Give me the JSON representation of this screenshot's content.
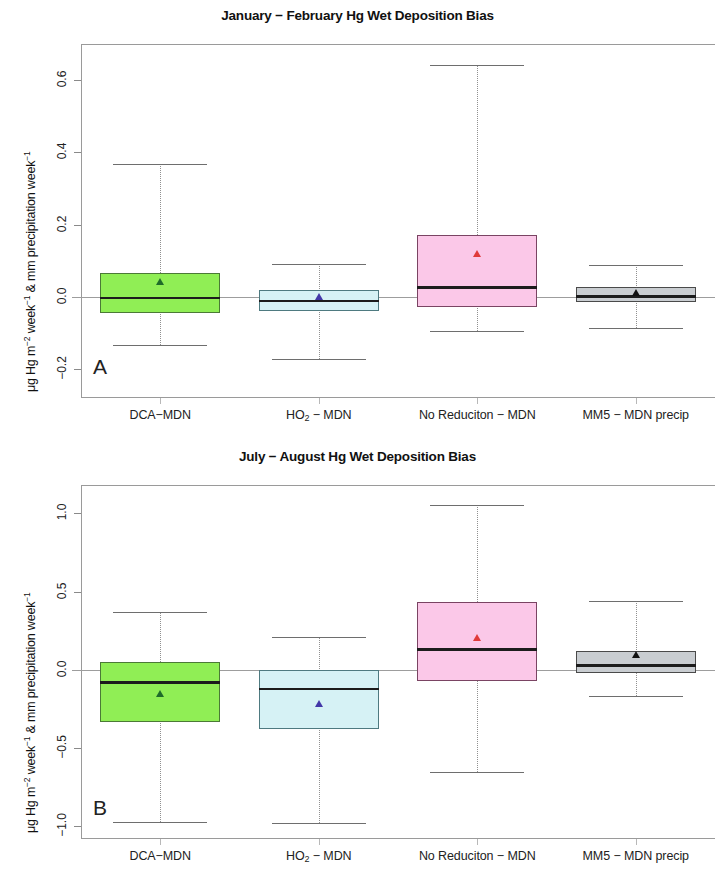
{
  "figure": {
    "y_axis_title_prefix": "μg Hg m",
    "y_axis_title_sup1": "−2",
    "y_axis_title_mid": " week",
    "y_axis_title_sup2": "−1",
    "y_axis_title_tail": " & mm precipitation week",
    "y_axis_title_sup3": "−1"
  },
  "chart_data": [
    {
      "type": "box",
      "panel_letter": "A",
      "title": "January − February Hg Wet Deposition Bias",
      "xlabel": "",
      "ylabel": "μg Hg m−2 week−1 & mm precipitation week−1",
      "ylim": [
        -0.28,
        0.7
      ],
      "yticks": [
        -0.2,
        0.0,
        0.2,
        0.4,
        0.6
      ],
      "ytick_labels": [
        "−0.2",
        "0.0",
        "0.2",
        "0.4",
        "0.6"
      ],
      "grid": false,
      "zero_line": 0.0,
      "categories": [
        "DCA−MDN",
        "HO2 − MDN",
        "No Reduciton − MDN",
        "MM5 − MDN precip"
      ],
      "boxes": [
        {
          "label": "DCA−MDN",
          "whisker_low": -0.133,
          "q1": -0.045,
          "median": -0.003,
          "q3": 0.066,
          "whisker_high": 0.367,
          "mean": 0.035,
          "fill": "#90EE55",
          "border": "#4b7a36",
          "mean_color": "#1f6b2a"
        },
        {
          "label": "HO2 − MDN",
          "whisker_low": -0.172,
          "q1": -0.038,
          "median": -0.011,
          "q3": 0.02,
          "whisker_high": 0.092,
          "mean": -0.005,
          "fill": "#D6F2F5",
          "border": "#4e7a80",
          "mean_color": "#4338a8"
        },
        {
          "label": "No Reduciton − MDN",
          "whisker_low": -0.095,
          "q1": -0.029,
          "median": 0.027,
          "q3": 0.172,
          "whisker_high": 0.641,
          "mean": 0.113,
          "fill": "#FBC8E8",
          "border": "#7a4463",
          "mean_color": "#e03a3a"
        },
        {
          "label": "MM5 − MDN precip",
          "whisker_low": -0.086,
          "q1": -0.015,
          "median": 0.002,
          "q3": 0.026,
          "whisker_high": 0.088,
          "mean": 0.004,
          "fill": "#C9CDD1",
          "border": "#4a4a4a",
          "mean_color": "#111111"
        }
      ]
    },
    {
      "type": "box",
      "panel_letter": "B",
      "title": "July − August Hg Wet Deposition Bias",
      "xlabel": "",
      "ylabel": "μg Hg m−2 week−1 & mm precipitation week−1",
      "ylim": [
        -1.08,
        1.18
      ],
      "yticks": [
        -1.0,
        -0.5,
        0.0,
        0.5,
        1.0
      ],
      "ytick_labels": [
        "−1.0",
        "−0.5",
        "0.0",
        "0.5",
        "1.0"
      ],
      "grid": false,
      "zero_line": 0.0,
      "categories": [
        "DCA−MDN",
        "HO2 − MDN",
        "No Reduciton − MDN",
        "MM5 − MDN precip"
      ],
      "boxes": [
        {
          "label": "DCA−MDN",
          "whisker_low": -0.97,
          "q1": -0.33,
          "median": -0.08,
          "q3": 0.05,
          "whisker_high": 0.37,
          "mean": -0.17,
          "fill": "#90EE55",
          "border": "#4b7a36",
          "mean_color": "#1f6b2a"
        },
        {
          "label": "HO2 − MDN",
          "whisker_low": -0.98,
          "q1": -0.38,
          "median": -0.12,
          "q3": 0.0,
          "whisker_high": 0.21,
          "mean": -0.23,
          "fill": "#D6F2F5",
          "border": "#4e7a80",
          "mean_color": "#4338a8"
        },
        {
          "label": "No Reduciton − MDN",
          "whisker_low": -0.65,
          "q1": -0.07,
          "median": 0.13,
          "q3": 0.43,
          "whisker_high": 1.05,
          "mean": 0.19,
          "fill": "#FBC8E8",
          "border": "#7a4463",
          "mean_color": "#e03a3a"
        },
        {
          "label": "MM5 − MDN precip",
          "whisker_low": -0.17,
          "q1": -0.02,
          "median": 0.03,
          "q3": 0.12,
          "whisker_high": 0.44,
          "mean": 0.08,
          "fill": "#C9CDD1",
          "border": "#4a4a4a",
          "mean_color": "#111111"
        }
      ]
    }
  ]
}
